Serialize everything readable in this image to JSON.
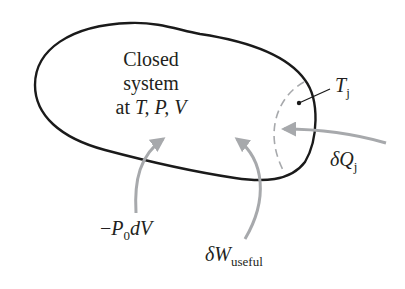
{
  "diagram": {
    "type": "thermodynamic system schematic",
    "system_label": {
      "line1": "Closed",
      "line2": "system",
      "line3_prefix": "at ",
      "line3_vars": "T, P, V"
    },
    "boundary_temperature": {
      "symbol": "T",
      "subscript": "j"
    },
    "heat_transfer": {
      "symbol": "δQ",
      "subscript": "j"
    },
    "boundary_work": {
      "prefix": "−",
      "symbol": "P",
      "subscript": "0",
      "suffix": "dV"
    },
    "useful_work": {
      "symbol": "δW",
      "subscript": "useful"
    },
    "colors": {
      "outline": "#1a1a1a",
      "arrow": "#a7a9ac",
      "dashed_boundary": "#a7a9ac",
      "text": "#231f20"
    }
  }
}
